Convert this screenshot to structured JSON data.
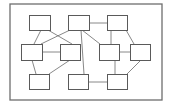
{
  "diagram": {
    "type": "block-network",
    "colors": {
      "background": "#ffffff",
      "frame_stroke": "#6e6e6e",
      "node_stroke": "#5a5a5a",
      "edge_stroke": "#6a6a6a"
    },
    "frame": {
      "x": 10,
      "y": 4,
      "w": 152,
      "h": 96
    },
    "nodes": [
      {
        "id": "n1",
        "x": 29,
        "y": 15,
        "w": 21,
        "h": 15
      },
      {
        "id": "n2",
        "x": 68,
        "y": 15,
        "w": 21,
        "h": 15
      },
      {
        "id": "n3",
        "x": 107,
        "y": 15,
        "w": 20,
        "h": 15
      },
      {
        "id": "n4",
        "x": 21,
        "y": 44,
        "w": 21,
        "h": 16
      },
      {
        "id": "n5",
        "x": 60,
        "y": 44,
        "w": 20,
        "h": 16
      },
      {
        "id": "n6",
        "x": 99,
        "y": 44,
        "w": 20,
        "h": 16
      },
      {
        "id": "n7",
        "x": 130,
        "y": 44,
        "w": 20,
        "h": 16
      },
      {
        "id": "n8",
        "x": 29,
        "y": 74,
        "w": 20,
        "h": 15
      },
      {
        "id": "n9",
        "x": 68,
        "y": 74,
        "w": 20,
        "h": 15
      },
      {
        "id": "n10",
        "x": 107,
        "y": 74,
        "w": 20,
        "h": 15
      }
    ],
    "edges": [
      {
        "from": "n2",
        "to": "n3",
        "x1": 89,
        "y1": 23,
        "x2": 107,
        "y2": 23
      },
      {
        "from": "n1",
        "to": "n4",
        "x1": 41,
        "y1": 30,
        "x2": 34,
        "y2": 44
      },
      {
        "from": "n1",
        "to": "n5",
        "x1": 48,
        "y1": 30,
        "x2": 72,
        "y2": 44
      },
      {
        "from": "n2",
        "to": "n4",
        "x1": 70,
        "y1": 30,
        "x2": 41,
        "y2": 44
      },
      {
        "from": "n2",
        "to": "n6",
        "x1": 82,
        "y1": 30,
        "x2": 100,
        "y2": 44
      },
      {
        "from": "n2",
        "to": "n9",
        "x1": 81,
        "y1": 30,
        "x2": 84,
        "y2": 74
      },
      {
        "from": "n3",
        "to": "n6",
        "x1": 111,
        "y1": 30,
        "x2": 111,
        "y2": 44
      },
      {
        "from": "n3",
        "to": "n7",
        "x1": 126,
        "y1": 30,
        "x2": 134,
        "y2": 44
      },
      {
        "from": "n4",
        "to": "n5",
        "x1": 42,
        "y1": 52,
        "x2": 60,
        "y2": 52
      },
      {
        "from": "n6",
        "to": "n7",
        "x1": 119,
        "y1": 52,
        "x2": 130,
        "y2": 52
      },
      {
        "from": "n4",
        "to": "n8",
        "x1": 32,
        "y1": 60,
        "x2": 36,
        "y2": 74
      },
      {
        "from": "n5",
        "to": "n8",
        "x1": 70,
        "y1": 60,
        "x2": 49,
        "y2": 74
      },
      {
        "from": "n6",
        "to": "n10",
        "x1": 115,
        "y1": 60,
        "x2": 115,
        "y2": 74
      },
      {
        "from": "n7",
        "to": "n10",
        "x1": 141,
        "y1": 60,
        "x2": 127,
        "y2": 74
      },
      {
        "from": "n9",
        "to": "n10",
        "x1": 88,
        "y1": 82,
        "x2": 107,
        "y2": 82
      }
    ]
  }
}
